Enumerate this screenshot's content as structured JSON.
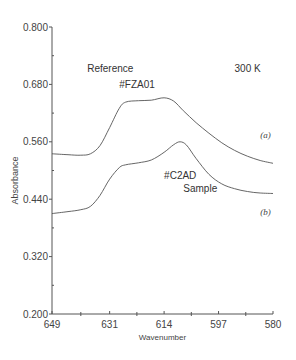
{
  "chart_data": {
    "type": "line",
    "title": "",
    "xlabel": "Wavenumber",
    "ylabel": "Absorbance",
    "xlim": [
      649,
      580
    ],
    "ylim": [
      0.2,
      0.8
    ],
    "x_ticks": [
      "649",
      "631",
      "614",
      "597",
      "580"
    ],
    "y_ticks": [
      "0.800",
      "0.680",
      "0.560",
      "0.440",
      "0.320",
      "0.200"
    ],
    "grid": false,
    "legend": null,
    "annotations": [
      {
        "text": "Reference",
        "x": 638,
        "y": 0.705
      },
      {
        "text": "#FZA01",
        "x": 628,
        "y": 0.672
      },
      {
        "text": "300 K",
        "x": 592,
        "y": 0.705
      },
      {
        "text": "(a)",
        "x": 584,
        "y": 0.568
      },
      {
        "text": "#C2AD",
        "x": 614,
        "y": 0.482
      },
      {
        "text": "Sample",
        "x": 608,
        "y": 0.456
      },
      {
        "text": "(b)",
        "x": 584,
        "y": 0.408
      }
    ],
    "series": [
      {
        "name": "(a) Reference #FZA01",
        "x": [
          649,
          644,
          640,
          637,
          634,
          631,
          628,
          626,
          622,
          618,
          614,
          611,
          608,
          604,
          600,
          596,
          592,
          588,
          584,
          580
        ],
        "values": [
          0.535,
          0.533,
          0.532,
          0.535,
          0.552,
          0.59,
          0.63,
          0.643,
          0.646,
          0.647,
          0.652,
          0.645,
          0.625,
          0.6,
          0.578,
          0.558,
          0.542,
          0.53,
          0.521,
          0.515
        ]
      },
      {
        "name": "(b) Sample #C2AD",
        "x": [
          649,
          644,
          640,
          637,
          634,
          631,
          628,
          626,
          622,
          618,
          614,
          611,
          609,
          607,
          604,
          600,
          596,
          592,
          588,
          584,
          580
        ],
        "values": [
          0.41,
          0.414,
          0.418,
          0.425,
          0.448,
          0.482,
          0.506,
          0.512,
          0.516,
          0.522,
          0.538,
          0.554,
          0.56,
          0.553,
          0.525,
          0.492,
          0.472,
          0.462,
          0.456,
          0.453,
          0.452
        ]
      }
    ]
  },
  "colors": {
    "line": "#555555",
    "axis": "#555555",
    "text": "#333333"
  }
}
